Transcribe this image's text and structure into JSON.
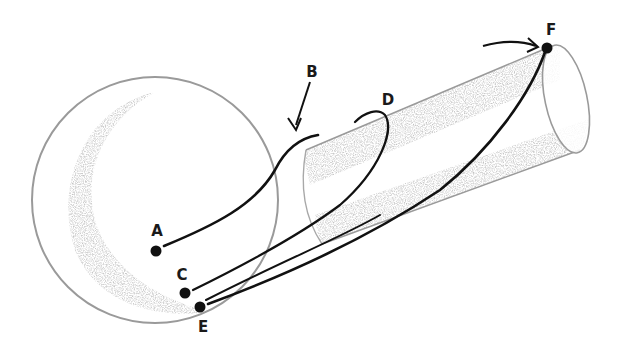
{
  "diagram": {
    "colors": {
      "background": "#ffffff",
      "outline": "#9a9a9a",
      "shading": "#c8c8c8",
      "curve": "#111111",
      "point": "#111111",
      "label": "#1a1a1a"
    },
    "shapes": {
      "sphere": {
        "cx": 155,
        "cy": 200,
        "r": 123
      },
      "cylinder": {
        "near_end": [
          306,
          150,
          322,
          244
        ],
        "far_end_center": [
          566,
          100
        ],
        "far_end_rx": 22,
        "far_end_ry": 55
      }
    },
    "points": [
      {
        "id": "A",
        "label": "A",
        "x": 156,
        "y": 251,
        "label_x": 157,
        "label_y": 231
      },
      {
        "id": "C",
        "label": "C",
        "x": 185,
        "y": 293,
        "label_x": 182,
        "label_y": 275
      },
      {
        "id": "E",
        "label": "E",
        "x": 200,
        "y": 307,
        "label_x": 203,
        "label_y": 327
      },
      {
        "id": "F",
        "label": "F",
        "x": 547,
        "y": 48,
        "label_x": 551,
        "label_y": 30
      }
    ],
    "annotations": [
      {
        "id": "B",
        "label": "B",
        "label_x": 312,
        "label_y": 72,
        "note": "arrow pointing to curve A-B end"
      },
      {
        "id": "D",
        "label": "D",
        "label_x": 388,
        "label_y": 100,
        "note": "end of curve from C looping over cylinder"
      }
    ],
    "curves": [
      {
        "from": "A",
        "to": "B"
      },
      {
        "from": "C",
        "to": "D"
      },
      {
        "from": "E",
        "to": "F"
      },
      {
        "from": "E",
        "to": "F",
        "note": "second strand"
      }
    ]
  }
}
